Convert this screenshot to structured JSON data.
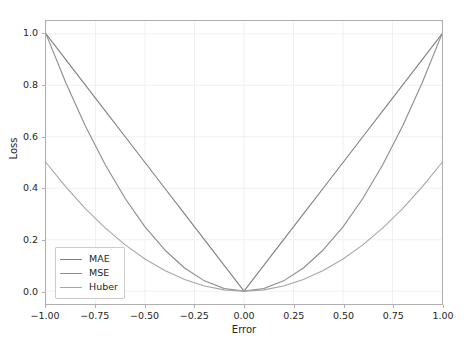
{
  "chart_data": {
    "type": "line",
    "title": "",
    "xlabel": "Error",
    "ylabel": "Loss",
    "xlim": [
      -1.0,
      1.0
    ],
    "ylim": [
      -0.05,
      1.05
    ],
    "grid": true,
    "legend_position": "lower left",
    "x_ticks": [
      -1.0,
      -0.75,
      -0.5,
      -0.25,
      0.0,
      0.25,
      0.5,
      0.75,
      1.0
    ],
    "x_tick_labels": [
      "−1.00",
      "−0.75",
      "−0.50",
      "−0.25",
      "0.00",
      "0.25",
      "0.50",
      "0.75",
      "1.00"
    ],
    "y_ticks": [
      0.0,
      0.2,
      0.4,
      0.6,
      0.8,
      1.0
    ],
    "y_tick_labels": [
      "0.0",
      "0.2",
      "0.4",
      "0.6",
      "0.8",
      "1.0"
    ],
    "x": [
      -1.0,
      -0.9,
      -0.8,
      -0.7,
      -0.6,
      -0.5,
      -0.4,
      -0.3,
      -0.2,
      -0.1,
      0.0,
      0.1,
      0.2,
      0.3,
      0.4,
      0.5,
      0.6,
      0.7,
      0.8,
      0.9,
      1.0
    ],
    "series": [
      {
        "name": "MAE",
        "color": "#7f7f7f",
        "formula": "|e|",
        "values": [
          1.0,
          0.9,
          0.8,
          0.7,
          0.6,
          0.5,
          0.4,
          0.3,
          0.2,
          0.1,
          0.0,
          0.1,
          0.2,
          0.3,
          0.4,
          0.5,
          0.6,
          0.7,
          0.8,
          0.9,
          1.0
        ]
      },
      {
        "name": "MSE",
        "color": "#8c8c8c",
        "formula": "e^2",
        "values": [
          1.0,
          0.81,
          0.64,
          0.49,
          0.36,
          0.25,
          0.16,
          0.09,
          0.04,
          0.01,
          0.0,
          0.01,
          0.04,
          0.09,
          0.16,
          0.25,
          0.36,
          0.49,
          0.64,
          0.81,
          1.0
        ]
      },
      {
        "name": "Huber",
        "color": "#a6a6a6",
        "formula": "0.5*e^2 (delta=1)",
        "values": [
          0.5,
          0.405,
          0.32,
          0.245,
          0.18,
          0.125,
          0.08,
          0.045,
          0.02,
          0.005,
          0.0,
          0.005,
          0.02,
          0.045,
          0.08,
          0.125,
          0.18,
          0.245,
          0.32,
          0.405,
          0.5
        ]
      }
    ],
    "colors": {
      "grid": "#f0f0f0",
      "frame": "#b0b0b0",
      "text": "#262626",
      "background": "#ffffff",
      "legend_border": "#cccccc"
    }
  }
}
